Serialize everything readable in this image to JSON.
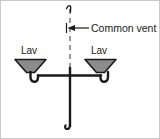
{
  "diagram": {
    "type": "plumbing-schematic",
    "background_color": "#ffffff",
    "border_color": "#c8c8c8",
    "pipe_color": "#1a1a1a",
    "fixture_fill_color": "#8c8c8c",
    "fixture_stroke_color": "#1a1a1a",
    "vent_line_color": "#6e6e6e",
    "vent_line_style": "dashed",
    "labels": {
      "common_vent": "Common vent",
      "left_fixture": "Lav",
      "right_fixture": "Lav"
    },
    "annotations": {
      "leader_line": "horizontal leader from arrowhead to text",
      "arrow_direction": "left",
      "top_break": "broken-pipe squiggle at top of vent stack",
      "bottom_break": "broken-pipe squiggle at bottom of drain stack"
    },
    "components": [
      {
        "name": "common-vent-stack",
        "orientation": "vertical",
        "style": "dashed"
      },
      {
        "name": "left-lavatory",
        "shape": "trapezoid-funnel"
      },
      {
        "name": "left-p-trap",
        "shape": "u-bend"
      },
      {
        "name": "right-lavatory",
        "shape": "trapezoid-funnel"
      },
      {
        "name": "right-p-trap",
        "shape": "u-bend"
      },
      {
        "name": "horizontal-branch-drain",
        "orientation": "horizontal"
      },
      {
        "name": "vertical-drain-stack",
        "orientation": "vertical"
      }
    ]
  }
}
